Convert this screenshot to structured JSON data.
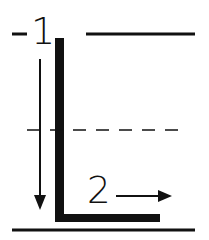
{
  "diagram": {
    "labels": {
      "one": "1",
      "two": "2"
    },
    "colors": {
      "ink": "#111111",
      "background": "#ffffff"
    },
    "elements": [
      "top-reference-line",
      "downward-arrow-1",
      "L-shaped-plate",
      "dashed-midline",
      "rightward-arrow-2",
      "ground-line"
    ]
  }
}
